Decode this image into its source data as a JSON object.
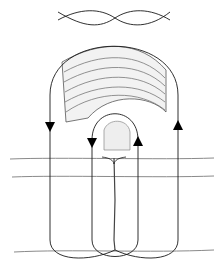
{
  "figure": {
    "colors": {
      "line": "#1a1a1a",
      "texture": "#9a9a9a",
      "background": "#ffffff"
    },
    "arrows": [
      {
        "id": "outer-left",
        "direction": "down"
      },
      {
        "id": "inner-left",
        "direction": "down"
      },
      {
        "id": "inner-right",
        "direction": "up"
      },
      {
        "id": "outer-right",
        "direction": "up"
      }
    ]
  }
}
